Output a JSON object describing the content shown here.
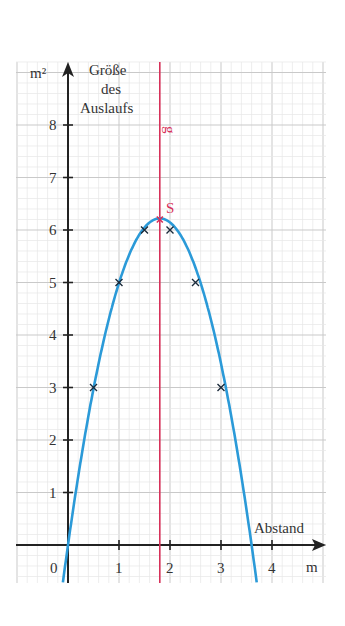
{
  "chart_data": {
    "type": "line",
    "title": "",
    "xlabel": "Abstand",
    "xunit": "m",
    "ylabel": "Größe des Auslaufs",
    "yunit": "m²",
    "ylabel_lines": [
      "Größe",
      "des",
      "Auslaufs"
    ],
    "xlim": [
      -1,
      5
    ],
    "ylim": [
      -0.7,
      9.3
    ],
    "x_ticks": [
      "0",
      "1",
      "2",
      "3",
      "4"
    ],
    "y_ticks": [
      "1",
      "2",
      "3",
      "4",
      "5",
      "6",
      "7",
      "8"
    ],
    "grid": true,
    "series": [
      {
        "name": "Parabel",
        "color": "#2b9ad8",
        "function": "y = -1.92·x·(x - 3.6)",
        "points": [
          {
            "x": 0.5,
            "y": 3
          },
          {
            "x": 1,
            "y": 5
          },
          {
            "x": 1.5,
            "y": 6
          },
          {
            "x": 2,
            "y": 6
          },
          {
            "x": 2.5,
            "y": 5
          },
          {
            "x": 3,
            "y": 3
          }
        ]
      }
    ],
    "annotations": [
      {
        "label": "S",
        "x": 1.8,
        "y": 6.2,
        "color": "#d7315a",
        "type": "vertex"
      },
      {
        "label": "g",
        "x": 1.8,
        "color": "#d7315a",
        "type": "axis-of-symmetry"
      }
    ]
  },
  "labels": {
    "y_unit": "m²",
    "y_title_1": "Größe",
    "y_title_2": "des",
    "y_title_3": "Auslaufs",
    "x_title": "Abstand",
    "x_unit": "m",
    "origin": "0",
    "vertex": "S",
    "symmetry_line": "g"
  },
  "colors": {
    "curve": "#2b9ad8",
    "accent": "#d7315a",
    "axis": "#222222",
    "grid_major": "#c9c9c9",
    "grid_minor": "#e6e6e6"
  }
}
